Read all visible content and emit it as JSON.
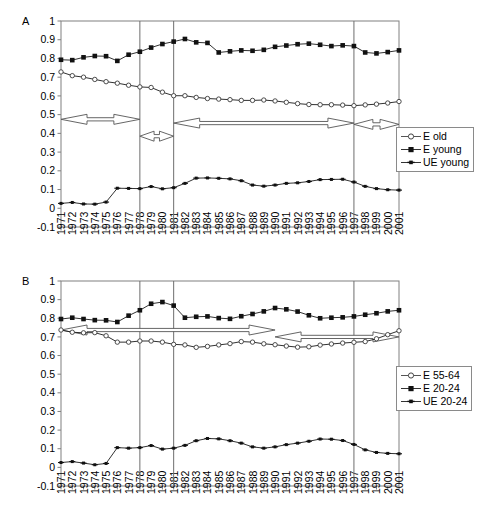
{
  "figure": {
    "background": "#ffffff",
    "axis_color": "#808080",
    "line_color": "#1a1a1a",
    "arrow_color": "#555555"
  },
  "panels": [
    {
      "letter": "A",
      "legend": {
        "items": [
          {
            "label": "E old",
            "marker": "open-circle"
          },
          {
            "label": "E young",
            "marker": "filled-square"
          },
          {
            "label": "UE young",
            "marker": "filled-plus"
          }
        ]
      }
    },
    {
      "letter": "B",
      "legend": {
        "items": [
          {
            "label": "E 55-64",
            "marker": "open-circle"
          },
          {
            "label": "E 20-24",
            "marker": "filled-square"
          },
          {
            "label": "UE 20-24",
            "marker": "filled-plus"
          }
        ]
      }
    }
  ],
  "chart_data": [
    {
      "type": "line",
      "title": "A",
      "xlabel": "",
      "ylabel": "",
      "grid": false,
      "legend_position": "right",
      "ylim": [
        -0.1,
        1
      ],
      "yticks": [
        -0.1,
        0,
        0.1,
        0.2,
        0.3,
        0.4,
        0.5,
        0.6,
        0.7,
        0.8,
        0.9,
        1
      ],
      "ytick_labels": [
        "-0.1",
        "0",
        "0.1",
        "0.2",
        "0.3",
        "0.4",
        "0.5",
        "0.6",
        "0.7",
        "0.8",
        "0.9",
        "1"
      ],
      "x": [
        1971,
        1972,
        1973,
        1974,
        1975,
        1976,
        1977,
        1978,
        1979,
        1980,
        1981,
        1982,
        1983,
        1984,
        1985,
        1986,
        1987,
        1988,
        1989,
        1990,
        1991,
        1992,
        1993,
        1994,
        1995,
        1996,
        1997,
        1998,
        1999,
        2000,
        2001
      ],
      "xtick_labels": [
        "1971",
        "1972",
        "1973",
        "1974",
        "1975",
        "1976",
        "1977",
        "1978",
        "1979",
        "1980",
        "1981",
        "1982",
        "1983",
        "1984",
        "1985",
        "1986",
        "1987",
        "1988",
        "1989",
        "1990",
        "1991",
        "1992",
        "1993",
        "1994",
        "1995",
        "1996",
        "1997",
        "1998",
        "1999",
        "2000",
        "2001"
      ],
      "series": [
        {
          "name": "E old",
          "marker": "open-circle",
          "values": [
            0.728,
            0.708,
            0.7,
            0.688,
            0.676,
            0.668,
            0.657,
            0.648,
            0.645,
            0.62,
            0.601,
            0.601,
            0.592,
            0.586,
            0.583,
            0.58,
            0.576,
            0.576,
            0.578,
            0.573,
            0.566,
            0.559,
            0.554,
            0.553,
            0.553,
            0.551,
            0.548,
            0.552,
            0.556,
            0.562,
            0.57
          ]
        },
        {
          "name": "E young",
          "marker": "filled-square",
          "values": [
            0.793,
            0.791,
            0.806,
            0.813,
            0.812,
            0.787,
            0.82,
            0.836,
            0.858,
            0.877,
            0.89,
            0.904,
            0.886,
            0.883,
            0.832,
            0.838,
            0.843,
            0.841,
            0.846,
            0.862,
            0.869,
            0.876,
            0.879,
            0.873,
            0.866,
            0.87,
            0.866,
            0.832,
            0.827,
            0.834,
            0.843
          ]
        },
        {
          "name": "UE young",
          "marker": "filled-plus",
          "values": [
            0.026,
            0.031,
            0.023,
            0.022,
            0.033,
            0.107,
            0.106,
            0.105,
            0.116,
            0.104,
            0.11,
            0.133,
            0.161,
            0.162,
            0.16,
            0.157,
            0.147,
            0.124,
            0.118,
            0.124,
            0.133,
            0.136,
            0.143,
            0.153,
            0.154,
            0.155,
            0.14,
            0.117,
            0.105,
            0.099,
            0.097
          ]
        }
      ],
      "reference_lines": [
        1978,
        1981,
        1997
      ],
      "annotations": [
        {
          "type": "double-arrow",
          "from": 1971,
          "to": 1978,
          "y": 0.475,
          "label": ""
        },
        {
          "type": "double-arrow",
          "from": 1978,
          "to": 1981,
          "y": 0.385,
          "label": ""
        },
        {
          "type": "double-arrow",
          "from": 1981,
          "to": 1997,
          "y": 0.455,
          "label": ""
        },
        {
          "type": "double-arrow",
          "from": 1997,
          "to": 2001,
          "y": 0.448,
          "label": ""
        }
      ]
    },
    {
      "type": "line",
      "title": "B",
      "xlabel": "",
      "ylabel": "",
      "grid": false,
      "legend_position": "right",
      "ylim": [
        -0.1,
        1
      ],
      "yticks": [
        -0.1,
        0,
        0.1,
        0.2,
        0.3,
        0.4,
        0.5,
        0.6,
        0.7,
        0.8,
        0.9,
        1
      ],
      "ytick_labels": [
        "-0.1",
        "0",
        "0.1",
        "0.2",
        "0.3",
        "0.4",
        "0.5",
        "0.6",
        "0.7",
        "0.8",
        "0.9",
        "1"
      ],
      "x": [
        1971,
        1972,
        1973,
        1974,
        1975,
        1976,
        1977,
        1978,
        1979,
        1980,
        1981,
        1982,
        1983,
        1984,
        1985,
        1986,
        1987,
        1988,
        1989,
        1990,
        1991,
        1992,
        1993,
        1994,
        1995,
        1996,
        1997,
        1998,
        1999,
        2000,
        2001
      ],
      "xtick_labels": [
        "1971",
        "1972",
        "1973",
        "1974",
        "1975",
        "1976",
        "1977",
        "1978",
        "1979",
        "1980",
        "1981",
        "1982",
        "1983",
        "1984",
        "1985",
        "1986",
        "1987",
        "1988",
        "1989",
        "1990",
        "1991",
        "1992",
        "1993",
        "1994",
        "1995",
        "1996",
        "1997",
        "1998",
        "1999",
        "2000",
        "2001"
      ],
      "series": [
        {
          "name": "E 55-64",
          "marker": "open-circle",
          "values": [
            0.737,
            0.725,
            0.722,
            0.723,
            0.706,
            0.672,
            0.672,
            0.678,
            0.678,
            0.672,
            0.66,
            0.657,
            0.644,
            0.649,
            0.657,
            0.664,
            0.675,
            0.672,
            0.663,
            0.658,
            0.651,
            0.645,
            0.647,
            0.656,
            0.662,
            0.667,
            0.671,
            0.675,
            0.69,
            0.712,
            0.733
          ]
        },
        {
          "name": "E 20-24",
          "marker": "filled-square",
          "values": [
            0.796,
            0.803,
            0.796,
            0.79,
            0.789,
            0.78,
            0.814,
            0.843,
            0.878,
            0.887,
            0.868,
            0.803,
            0.808,
            0.81,
            0.801,
            0.797,
            0.811,
            0.823,
            0.837,
            0.855,
            0.848,
            0.836,
            0.816,
            0.8,
            0.803,
            0.805,
            0.81,
            0.819,
            0.827,
            0.837,
            0.843
          ]
        },
        {
          "name": "UE 20-24",
          "marker": "filled-plus",
          "values": [
            0.026,
            0.031,
            0.023,
            0.014,
            0.021,
            0.106,
            0.103,
            0.106,
            0.117,
            0.098,
            0.103,
            0.118,
            0.143,
            0.155,
            0.153,
            0.143,
            0.13,
            0.11,
            0.103,
            0.11,
            0.122,
            0.13,
            0.14,
            0.152,
            0.151,
            0.144,
            0.123,
            0.094,
            0.08,
            0.075,
            0.073
          ]
        }
      ],
      "reference_lines": [
        1978,
        1981,
        1997
      ],
      "annotations": [
        {
          "type": "double-arrow",
          "from": 1971,
          "to": 1990,
          "y": 0.737,
          "label": ""
        },
        {
          "type": "double-arrow",
          "from": 1990,
          "to": 2001,
          "y": 0.7,
          "label": ""
        }
      ]
    }
  ]
}
